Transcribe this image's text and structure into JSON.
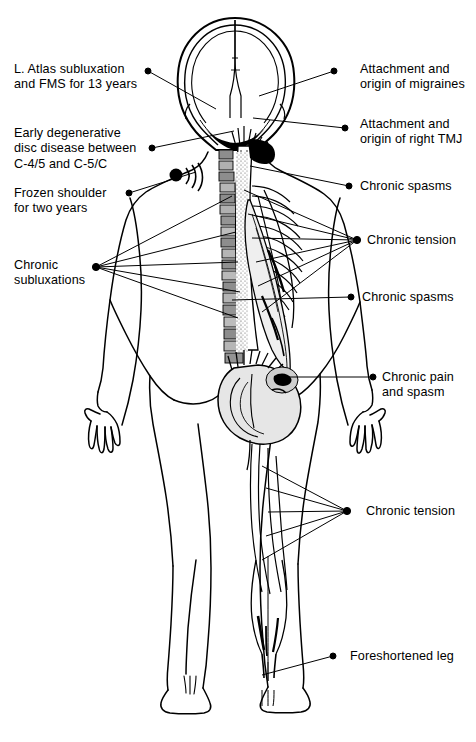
{
  "figure": {
    "view": "posterior",
    "ink_color": "#000000",
    "background_color": "#ffffff",
    "shading_color": "#9a9a9a",
    "highlight_color": "#000000"
  },
  "annotations": {
    "left": [
      {
        "id": "atlas-subluxation",
        "text": "L. Atlas subluxation\nand FMS for 13 years",
        "label_x": 14,
        "label_y": 62,
        "dot_x": 148,
        "dot_y": 71,
        "targets": [
          [
            216,
            109
          ]
        ]
      },
      {
        "id": "disc-disease",
        "text": "Early degenerative\ndisc disease between\nC-4/5 and C-5/C",
        "label_x": 14,
        "label_y": 126,
        "dot_x": 152,
        "dot_y": 148,
        "targets": [
          [
            234,
            131
          ]
        ]
      },
      {
        "id": "frozen-shoulder",
        "text": "Frozen shoulder\nfor two years",
        "label_x": 14,
        "label_y": 186,
        "dot_x": 129,
        "dot_y": 193,
        "targets": [
          [
            196,
            172
          ]
        ]
      },
      {
        "id": "chronic-subluxations",
        "text": "Chronic\nsubluxations",
        "label_x": 14,
        "label_y": 258,
        "dot_x": 96,
        "dot_y": 267,
        "targets": [
          [
            232,
            196
          ],
          [
            236,
            232
          ],
          [
            238,
            262
          ],
          [
            240,
            292
          ],
          [
            238,
            318
          ]
        ]
      }
    ],
    "right": [
      {
        "id": "migraines",
        "text": "Attachment and\norigin of migraines",
        "label_x": 360,
        "label_y": 62,
        "dot_x": 334,
        "dot_y": 71,
        "targets": [
          [
            259,
            96
          ]
        ]
      },
      {
        "id": "right-tmj",
        "text": "Attachment and\norigin of right TMJ",
        "label_x": 360,
        "label_y": 117,
        "dot_x": 345,
        "dot_y": 128,
        "targets": [
          [
            253,
            118
          ]
        ]
      },
      {
        "id": "chronic-spasms-upper",
        "text": "Chronic spasms",
        "label_x": 360,
        "label_y": 179,
        "dot_x": 349,
        "dot_y": 186,
        "targets": [
          [
            250,
            166
          ]
        ]
      },
      {
        "id": "chronic-tension-upper",
        "text": "Chronic tension",
        "label_x": 367,
        "label_y": 233,
        "dot_x": 357,
        "dot_y": 240,
        "targets": [
          [
            244,
            190
          ],
          [
            248,
            214
          ],
          [
            252,
            238
          ],
          [
            256,
            262
          ],
          [
            258,
            286
          ],
          [
            262,
            312
          ]
        ]
      },
      {
        "id": "chronic-spasms-lower",
        "text": "Chronic spasms",
        "label_x": 362,
        "label_y": 290,
        "dot_x": 351,
        "dot_y": 297,
        "targets": [
          [
            232,
            300
          ]
        ]
      },
      {
        "id": "chronic-pain-spasm",
        "text": "Chronic pain\nand spasm",
        "label_x": 382,
        "label_y": 370,
        "dot_x": 373,
        "dot_y": 377,
        "targets": [
          [
            288,
            377
          ]
        ]
      },
      {
        "id": "chronic-tension-lower",
        "text": "Chronic tension",
        "label_x": 366,
        "label_y": 504,
        "dot_x": 347,
        "dot_y": 511,
        "targets": [
          [
            262,
            466
          ],
          [
            266,
            488
          ],
          [
            268,
            512
          ],
          [
            266,
            536
          ],
          [
            262,
            560
          ]
        ]
      },
      {
        "id": "foreshortened-leg",
        "text": "Foreshortened leg",
        "label_x": 350,
        "label_y": 649,
        "dot_x": 333,
        "dot_y": 656,
        "targets": [
          [
            262,
            675
          ]
        ]
      }
    ]
  }
}
